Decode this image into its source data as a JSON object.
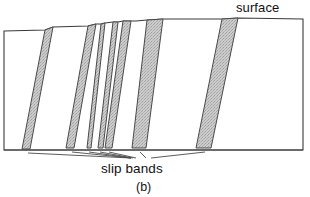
{
  "figure": {
    "panel_label": "(b)",
    "labels": {
      "surface": "surface",
      "slip_bands": "slip bands"
    },
    "colors": {
      "outline": "#3a3a3a",
      "band_fill": "#c9c9c9",
      "band_edge": "#4a4a4a",
      "leader_line": "#4a4a4a",
      "background": "#ffffff",
      "text": "#111111"
    },
    "geometry": {
      "left_border_x": 4,
      "right_border_x": 303,
      "bottom_y": 150,
      "description": "Schematic cross-section of a metal specimen showing slip bands emerging at the free surface, producing a stepped surface profile."
    },
    "surface_profile": [
      {
        "x": 4,
        "y": 31
      },
      {
        "x": 45,
        "y": 30
      },
      {
        "x": 53,
        "y": 27
      },
      {
        "x": 88,
        "y": 26
      },
      {
        "x": 96,
        "y": 24
      },
      {
        "x": 101,
        "y": 24
      },
      {
        "x": 105,
        "y": 23
      },
      {
        "x": 113,
        "y": 22
      },
      {
        "x": 118,
        "y": 22
      },
      {
        "x": 123,
        "y": 21
      },
      {
        "x": 131,
        "y": 21
      },
      {
        "x": 136,
        "y": 21
      },
      {
        "x": 147,
        "y": 20
      },
      {
        "x": 163,
        "y": 19
      },
      {
        "x": 222,
        "y": 19
      },
      {
        "x": 238,
        "y": 18
      },
      {
        "x": 303,
        "y": 19
      }
    ],
    "slip_bands": [
      {
        "id": 1,
        "top_left_x": 45,
        "top_right_x": 53,
        "top_y": 29,
        "bottom_left_x": 22,
        "bottom_right_x": 30,
        "bottom_y": 149,
        "width": "wide"
      },
      {
        "id": 2,
        "top_left_x": 88,
        "top_right_x": 96,
        "top_y": 26,
        "bottom_left_x": 66,
        "bottom_right_x": 74,
        "bottom_y": 148,
        "width": "wide"
      },
      {
        "id": 3,
        "top_left_x": 101,
        "top_right_x": 105,
        "top_y": 24,
        "bottom_left_x": 87,
        "bottom_right_x": 91,
        "bottom_y": 148,
        "width": "narrow"
      },
      {
        "id": 4,
        "top_left_x": 113,
        "top_right_x": 118,
        "top_y": 23,
        "bottom_left_x": 98,
        "bottom_right_x": 103,
        "bottom_y": 148,
        "width": "narrow"
      },
      {
        "id": 5,
        "top_left_x": 123,
        "top_right_x": 131,
        "top_y": 22,
        "bottom_left_x": 105,
        "bottom_right_x": 112,
        "bottom_y": 148,
        "width": "narrow"
      },
      {
        "id": 6,
        "top_left_x": 147,
        "top_right_x": 163,
        "top_y": 20,
        "bottom_left_x": 132,
        "bottom_right_x": 146,
        "bottom_y": 148,
        "width": "wide"
      },
      {
        "id": 7,
        "top_left_x": 222,
        "top_right_x": 238,
        "top_y": 19,
        "bottom_left_x": 196,
        "bottom_right_x": 211,
        "bottom_y": 148,
        "width": "wide"
      }
    ],
    "leader_lines": [
      {
        "from_x": 28,
        "from_y": 153,
        "to_x": 131,
        "to_y": 158
      },
      {
        "from_x": 72,
        "from_y": 152,
        "to_x": 131,
        "to_y": 158
      },
      {
        "from_x": 89,
        "from_y": 152,
        "to_x": 131,
        "to_y": 158
      },
      {
        "from_x": 100,
        "from_y": 152,
        "to_x": 133,
        "to_y": 158
      },
      {
        "from_x": 109,
        "from_y": 152,
        "to_x": 136,
        "to_y": 158
      },
      {
        "from_x": 140,
        "from_y": 152,
        "to_x": 145,
        "to_y": 158
      },
      {
        "from_x": 205,
        "from_y": 152,
        "to_x": 150,
        "to_y": 158
      }
    ]
  }
}
